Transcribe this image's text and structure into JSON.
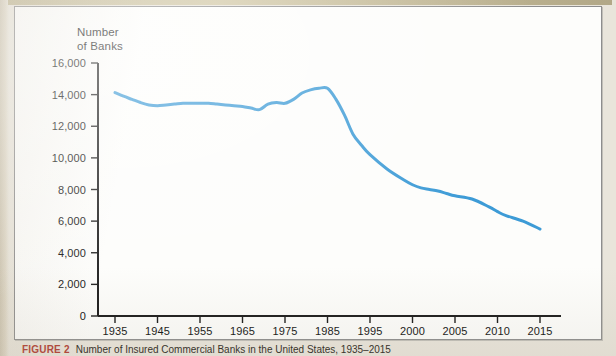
{
  "figure": {
    "caption_label": "FIGURE 2",
    "caption_text": "Number of Insured Commercial Banks in the United States, 1935–2015",
    "panel_background": "#fdfdfb",
    "page_background": "#e9e5db"
  },
  "chart_data": {
    "type": "line",
    "title": "",
    "ylabel": "Number\nof Banks",
    "xlabel": "",
    "ylim": [
      0,
      16000
    ],
    "ytick_labels": [
      "0",
      "2,000",
      "4,000",
      "6,000",
      "8,000",
      "10,000",
      "12,000",
      "14,000",
      "16,000"
    ],
    "ytick_values": [
      0,
      2000,
      4000,
      6000,
      8000,
      10000,
      12000,
      14000,
      16000
    ],
    "xtick_labels": [
      "1935",
      "1945",
      "1955",
      "1965",
      "1975",
      "1985",
      "1995",
      "2000",
      "2005",
      "2010",
      "2015"
    ],
    "xtick_values": [
      1935,
      1945,
      1955,
      1965,
      1975,
      1985,
      1995,
      2000,
      2005,
      2010,
      2015
    ],
    "axis_note": "x-axis spacing is irregular: 10-year steps from 1935 to 1985, then 5-year steps from 1995 to 2015",
    "grid": false,
    "legend": "none",
    "line_color": "#3d9bd6",
    "line_width": 3,
    "series": [
      {
        "name": "Number of Banks",
        "x": [
          1935,
          1937,
          1939,
          1941,
          1943,
          1945,
          1947,
          1949,
          1951,
          1953,
          1955,
          1957,
          1959,
          1961,
          1963,
          1965,
          1967,
          1969,
          1971,
          1973,
          1975,
          1977,
          1979,
          1981,
          1983,
          1985,
          1987,
          1989,
          1991,
          1993,
          1995,
          1997,
          1999,
          2000,
          2001,
          2002,
          2003,
          2004,
          2005,
          2007,
          2009,
          2010,
          2011,
          2013,
          2015
        ],
        "values": [
          14125,
          13900,
          13700,
          13500,
          13350,
          13300,
          13350,
          13400,
          13450,
          13450,
          13450,
          13450,
          13400,
          13350,
          13300,
          13250,
          13150,
          13050,
          13400,
          13500,
          13450,
          13700,
          14100,
          14300,
          14400,
          14400,
          13700,
          12700,
          11500,
          10800,
          10200,
          9300,
          8600,
          8300,
          8100,
          8000,
          7900,
          7750,
          7600,
          7400,
          6900,
          6600,
          6350,
          6000,
          5500
        ]
      }
    ]
  },
  "axes": {
    "y_axis_title_line1": "Number",
    "y_axis_title_line2": "of Banks"
  }
}
